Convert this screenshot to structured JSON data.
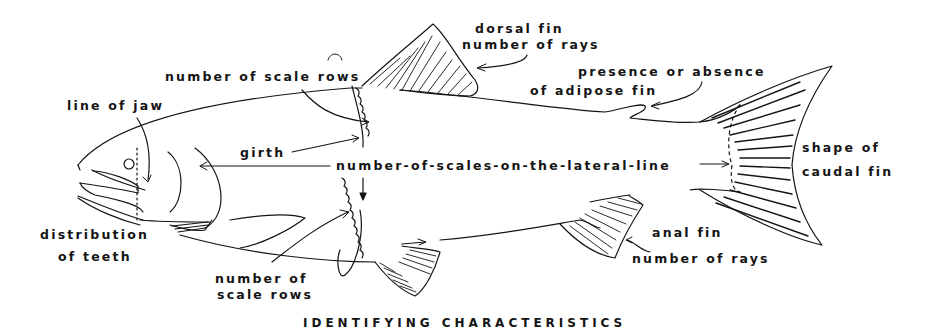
{
  "diagram": {
    "title": "IDENTIFYING CHARACTERISTICS",
    "colors": {
      "ink": "#141414",
      "background": "#ffffff"
    },
    "labels": {
      "dorsal_fin_1": "dorsal fin",
      "dorsal_fin_2": "number of rays",
      "scale_rows_top": "number of scale rows",
      "adipose_1": "presence or absence",
      "adipose_2": "of adipose fin",
      "line_of_jaw": "line of jaw",
      "girth": "girth",
      "lateral_line": "number-of-scales-on-the-lateral-line",
      "caudal_1": "shape of",
      "caudal_2": "caudal fin",
      "teeth_1": "distribution",
      "teeth_2": "of teeth",
      "scale_rows_bottom_1": "number of",
      "scale_rows_bottom_2": "scale rows",
      "anal_fin_1": "anal fin",
      "anal_fin_2": "number of rays"
    }
  }
}
